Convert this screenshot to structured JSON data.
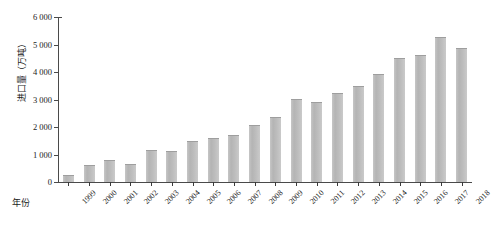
{
  "chart_data": {
    "type": "bar",
    "title": "",
    "xlabel": "年份",
    "ylabel": "进口量（万吨）",
    "categories": [
      "1999",
      "2000",
      "2001",
      "2002",
      "2003",
      "2004",
      "2005",
      "2006",
      "2007",
      "2008",
      "2009",
      "2010",
      "2011",
      "2012",
      "2013",
      "2014",
      "2015",
      "2016",
      "2017",
      "2018"
    ],
    "values": [
      432,
      1042,
      1394,
      1132,
      2074,
      2023,
      2659,
      2824,
      3082,
      3744,
      4255,
      5480,
      5264,
      5838,
      6338,
      7140,
      8169,
      8391,
      9553,
      8803
    ],
    "ytick_labels": [
      "0",
      "1 000",
      "2 000",
      "3 000",
      "4 000",
      "5 000",
      "6 000"
    ],
    "ytick_values": [
      0,
      1000,
      2000,
      3000,
      4000,
      5000,
      6000
    ],
    "ylim": [
      0,
      6000
    ],
    "grid": false,
    "legend": "none",
    "bar_color": "#bcbcbc",
    "axis_color": "#4a4a4a"
  }
}
